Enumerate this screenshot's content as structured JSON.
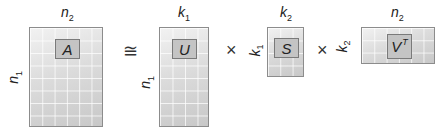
{
  "diagram": {
    "operators": {
      "approx": "≅",
      "times1": "×",
      "times2": "×"
    },
    "matrices": [
      {
        "name": "A",
        "label": "A",
        "superscript": "",
        "rows_label": "n",
        "rows_sub": "1",
        "cols_label": "n",
        "cols_sub": "2",
        "grid_cols": 6,
        "grid_rows": 8
      },
      {
        "name": "U",
        "label": "U",
        "superscript": "",
        "rows_label": "n",
        "rows_sub": "1",
        "cols_label": "k",
        "cols_sub": "1",
        "grid_cols": 4,
        "grid_rows": 8
      },
      {
        "name": "S",
        "label": "S",
        "superscript": "",
        "rows_label": "k",
        "rows_sub": "1",
        "cols_label": "k",
        "cols_sub": "2",
        "grid_cols": 3,
        "grid_rows": 4
      },
      {
        "name": "V",
        "label": "V",
        "superscript": "T",
        "rows_label": "k",
        "rows_sub": "2",
        "cols_label": "n",
        "cols_sub": "2",
        "grid_cols": 6,
        "grid_rows": 3
      }
    ],
    "colors": {
      "matrix_fill_light": "#f2f2f2",
      "matrix_fill_dark": "#c8c8c8",
      "border": "#8c8c8c",
      "block_fill": "#c4c4c4"
    }
  }
}
